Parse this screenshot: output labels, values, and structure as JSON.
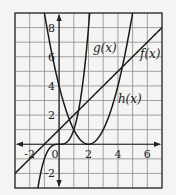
{
  "chart_data": {
    "type": "line",
    "title": "",
    "xlabel": "",
    "ylabel": "",
    "xlim": [
      -3,
      7
    ],
    "ylim": [
      -3,
      9
    ],
    "grid": true,
    "grid_step": 1,
    "x_tick_labels": [
      {
        "value": -2,
        "label": "-2"
      },
      {
        "value": 0,
        "label": "0"
      },
      {
        "value": 2,
        "label": "2"
      },
      {
        "value": 4,
        "label": "4"
      },
      {
        "value": 6,
        "label": "6"
      }
    ],
    "y_tick_labels": [
      {
        "value": -2,
        "label": "-2"
      },
      {
        "value": 2,
        "label": "2"
      },
      {
        "value": 4,
        "label": "4"
      },
      {
        "value": 6,
        "label": "6"
      },
      {
        "value": 8,
        "label": "8"
      }
    ],
    "series": [
      {
        "name": "f(x)",
        "label": "f(x)",
        "kind": "linear",
        "expression": "x + 1",
        "x": [
          -3,
          -1,
          0,
          1,
          3,
          4,
          6,
          7
        ],
        "values": [
          -2,
          0,
          1,
          2,
          4,
          5,
          7,
          8
        ]
      },
      {
        "name": "g(x)",
        "label": "g(x)",
        "kind": "cubic",
        "expression": "x^3",
        "x": [
          -1.44,
          -1,
          -0.5,
          0,
          0.5,
          1,
          1.5,
          2,
          2.08
        ],
        "values": [
          -3,
          -1,
          -0.125,
          0,
          0.125,
          1,
          3.375,
          8,
          9
        ]
      },
      {
        "name": "h(x)",
        "label": "h(x)",
        "kind": "quadratic",
        "expression": "(x - 2)^2",
        "x": [
          -1,
          0,
          1,
          2,
          3,
          4,
          5
        ],
        "values": [
          9,
          4,
          1,
          0,
          1,
          4,
          9
        ]
      }
    ],
    "annotations": [
      {
        "text": "g(x)",
        "x": 2.3,
        "y": 6.3
      },
      {
        "text": "f(x)",
        "x": 5.5,
        "y": 5.9
      },
      {
        "text": "h(x)",
        "x": 4.0,
        "y": 2.8
      }
    ]
  }
}
